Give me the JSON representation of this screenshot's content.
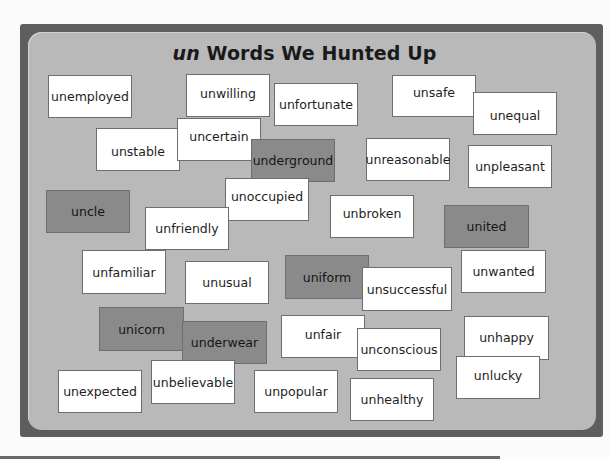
{
  "poster": {
    "title_prefix": "un",
    "title_rest": " Words We Hunted Up",
    "colors": {
      "frame": "#5e5e5e",
      "board": "#b9b9b9",
      "card_light": "#ffffff",
      "card_dark": "#8a8a8a"
    }
  },
  "cards": [
    {
      "word": "unemployed",
      "x": 48,
      "y": 75,
      "w": 84,
      "h": 43,
      "shade": "light",
      "ty": 0
    },
    {
      "word": "unwilling",
      "x": 186,
      "y": 74,
      "w": 84,
      "h": 43,
      "shade": "light",
      "ty": -2
    },
    {
      "word": "unfortunate",
      "x": 274,
      "y": 83,
      "w": 84,
      "h": 43,
      "shade": "light",
      "ty": 0
    },
    {
      "word": "unsafe",
      "x": 392,
      "y": 75,
      "w": 84,
      "h": 42,
      "shade": "light",
      "ty": -4
    },
    {
      "word": "unequal",
      "x": 473,
      "y": 92,
      "w": 84,
      "h": 43,
      "shade": "light",
      "ty": 2
    },
    {
      "word": "unstable",
      "x": 96,
      "y": 128,
      "w": 84,
      "h": 43,
      "shade": "light",
      "ty": 2
    },
    {
      "word": "uncertain",
      "x": 177,
      "y": 118,
      "w": 84,
      "h": 43,
      "shade": "light",
      "ty": -3
    },
    {
      "word": "underground",
      "x": 251,
      "y": 139,
      "w": 84,
      "h": 43,
      "shade": "dark",
      "ty": 0
    },
    {
      "word": "unreasonable",
      "x": 366,
      "y": 138,
      "w": 84,
      "h": 43,
      "shade": "light",
      "ty": 0
    },
    {
      "word": "unpleasant",
      "x": 468,
      "y": 145,
      "w": 84,
      "h": 43,
      "shade": "light",
      "ty": 0
    },
    {
      "word": "uncle",
      "x": 46,
      "y": 190,
      "w": 84,
      "h": 43,
      "shade": "dark",
      "ty": 0
    },
    {
      "word": "unoccupied",
      "x": 225,
      "y": 178,
      "w": 84,
      "h": 43,
      "shade": "light",
      "ty": -3
    },
    {
      "word": "unfriendly",
      "x": 145,
      "y": 207,
      "w": 84,
      "h": 43,
      "shade": "light",
      "ty": 0
    },
    {
      "word": "unbroken",
      "x": 330,
      "y": 195,
      "w": 84,
      "h": 43,
      "shade": "light",
      "ty": -3
    },
    {
      "word": "united",
      "x": 444,
      "y": 205,
      "w": 85,
      "h": 43,
      "shade": "dark",
      "ty": 0
    },
    {
      "word": "unfamiliar",
      "x": 82,
      "y": 250,
      "w": 84,
      "h": 44,
      "shade": "light",
      "ty": 0
    },
    {
      "word": "unusual",
      "x": 185,
      "y": 261,
      "w": 84,
      "h": 43,
      "shade": "light",
      "ty": 0
    },
    {
      "word": "uniform",
      "x": 285,
      "y": 255,
      "w": 84,
      "h": 44,
      "shade": "dark",
      "ty": 0
    },
    {
      "word": "unwanted",
      "x": 461,
      "y": 250,
      "w": 85,
      "h": 43,
      "shade": "light",
      "ty": 0
    },
    {
      "word": "unsuccessful",
      "x": 362,
      "y": 267,
      "w": 90,
      "h": 44,
      "shade": "light",
      "ty": 0
    },
    {
      "word": "unicorn",
      "x": 99,
      "y": 307,
      "w": 85,
      "h": 44,
      "shade": "dark",
      "ty": 0
    },
    {
      "word": "underwear",
      "x": 182,
      "y": 321,
      "w": 85,
      "h": 43,
      "shade": "dark",
      "ty": 0
    },
    {
      "word": "unfair",
      "x": 281,
      "y": 315,
      "w": 84,
      "h": 43,
      "shade": "light",
      "ty": -2
    },
    {
      "word": "unconscious",
      "x": 357,
      "y": 328,
      "w": 84,
      "h": 43,
      "shade": "light",
      "ty": 0
    },
    {
      "word": "unhappy",
      "x": 464,
      "y": 316,
      "w": 85,
      "h": 44,
      "shade": "light",
      "ty": -1
    },
    {
      "word": "unlucky",
      "x": 456,
      "y": 356,
      "w": 84,
      "h": 43,
      "shade": "light",
      "ty": -2
    },
    {
      "word": "unexpected",
      "x": 58,
      "y": 370,
      "w": 84,
      "h": 43,
      "shade": "light",
      "ty": 0
    },
    {
      "word": "unbelievable",
      "x": 151,
      "y": 360,
      "w": 84,
      "h": 44,
      "shade": "light",
      "ty": 0
    },
    {
      "word": "unpopular",
      "x": 254,
      "y": 370,
      "w": 84,
      "h": 43,
      "shade": "light",
      "ty": 0
    },
    {
      "word": "unhealthy",
      "x": 350,
      "y": 378,
      "w": 84,
      "h": 43,
      "shade": "light",
      "ty": 0
    }
  ]
}
